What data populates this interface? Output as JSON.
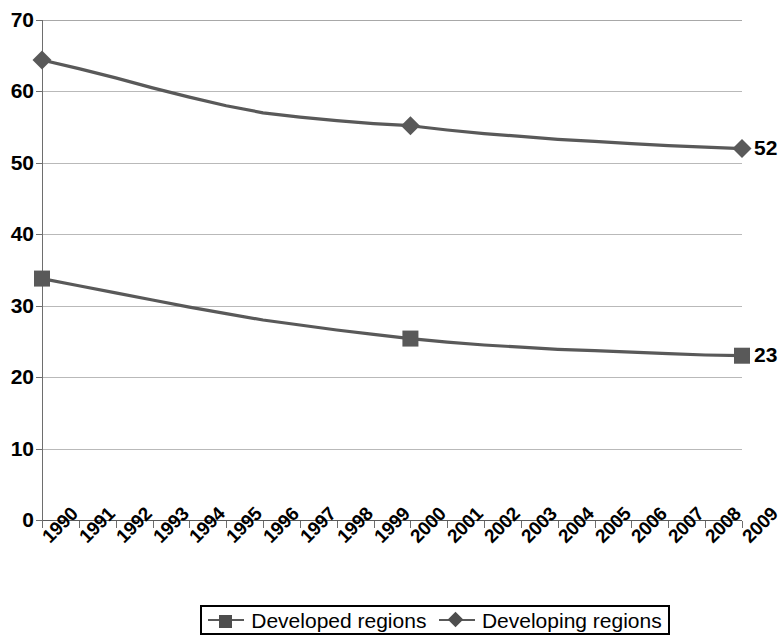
{
  "chart_data": {
    "type": "line",
    "title": "",
    "subtitle": "",
    "xlabel": "",
    "ylabel": "",
    "ylim": [
      0,
      70
    ],
    "ytick_values": [
      0,
      10,
      20,
      30,
      40,
      50,
      60,
      70
    ],
    "ytick_labels": [
      "0",
      "10",
      "20",
      "30",
      "40",
      "50",
      "60",
      "70"
    ],
    "grid": true,
    "legend_position": "bottom-center",
    "x": [
      1990,
      1991,
      1992,
      1993,
      1994,
      1995,
      1996,
      1997,
      1998,
      1999,
      2000,
      2001,
      2002,
      2003,
      2004,
      2005,
      2006,
      2007,
      2008,
      2009
    ],
    "categories": [
      "1990",
      "1991",
      "1992",
      "1993",
      "1994",
      "1995",
      "1996",
      "1997",
      "1998",
      "1999",
      "2000",
      "2001",
      "2002",
      "2003",
      "2004",
      "2005",
      "2006",
      "2007",
      "2008",
      "2009"
    ],
    "series": [
      {
        "name": "Developing regions",
        "marker": "diamond",
        "color": "#595959",
        "values": [
          64.4,
          63.2,
          61.9,
          60.5,
          59.2,
          58.0,
          57.0,
          56.4,
          55.9,
          55.5,
          55.2,
          54.6,
          54.1,
          53.7,
          53.3,
          53.0,
          52.7,
          52.4,
          52.2,
          52.0
        ],
        "marker_points": [
          {
            "x": "1990",
            "y": 64.4
          },
          {
            "x": "2000",
            "y": 55.2
          },
          {
            "x": "2009",
            "y": 52.0
          }
        ],
        "end_label": "52"
      },
      {
        "name": "Developed regions",
        "marker": "square",
        "color": "#595959",
        "values": [
          33.8,
          32.8,
          31.8,
          30.8,
          29.8,
          28.9,
          28.0,
          27.3,
          26.6,
          26.0,
          25.4,
          24.9,
          24.5,
          24.2,
          23.9,
          23.7,
          23.5,
          23.3,
          23.1,
          23.0
        ],
        "marker_points": [
          {
            "x": "1990",
            "y": 33.8
          },
          {
            "x": "2000",
            "y": 25.4
          },
          {
            "x": "2009",
            "y": 23.0
          }
        ],
        "end_label": "23"
      }
    ],
    "annotations": [
      {
        "text": "52",
        "series": "Developing regions",
        "at_x": "2009"
      },
      {
        "text": "23",
        "series": "Developed regions",
        "at_x": "2009"
      }
    ]
  },
  "legend": {
    "entries": [
      {
        "label": "Developed regions",
        "marker": "square-marker-icon"
      },
      {
        "label": "Developing regions",
        "marker": "diamond-marker-icon"
      }
    ]
  },
  "colors": {
    "series_line": "#595959",
    "marker_fill": "#4d4d4d",
    "gridline": "#b9b9b9",
    "axis": "#6e6e6e",
    "text": "#000000",
    "background": "#ffffff"
  }
}
